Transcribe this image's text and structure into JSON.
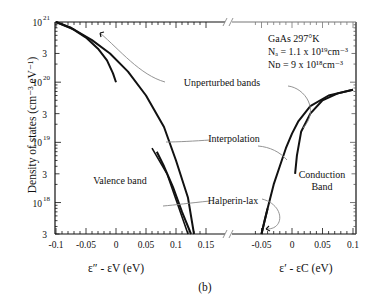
{
  "chart_data": {
    "type": "line",
    "title": "",
    "subfigure_label": "(b)",
    "ylabel": "Density of states (cm⁻³ eV⁻¹)",
    "yscale": "log",
    "ylim": [
      3e+17,
      1e+21
    ],
    "y_ticks": [
      {
        "value": 1e+21,
        "label_base": "10",
        "label_exp": "21"
      },
      {
        "value": 3e+20,
        "label_base": "3",
        "label_exp": ""
      },
      {
        "value": 1e+20,
        "label_base": "10",
        "label_exp": "20"
      },
      {
        "value": 3e+19,
        "label_base": "3",
        "label_exp": ""
      },
      {
        "value": 1e+19,
        "label_base": "10",
        "label_exp": "19"
      },
      {
        "value": 3e+18,
        "label_base": "3",
        "label_exp": ""
      },
      {
        "value": 1e+18,
        "label_base": "10",
        "label_exp": "18"
      },
      {
        "value": 3e+17,
        "label_base": "3",
        "label_exp": ""
      }
    ],
    "info_box": {
      "material": "GaAs  297°K",
      "NA": "Nₐ = 1.1 x 10¹⁹cm⁻³",
      "ND": "Nᴅ = 9 x 10¹⁸cm⁻³"
    },
    "panels": [
      {
        "name": "valence",
        "xlabel": "ε″ - εV (eV)",
        "xlim": [
          -0.1,
          0.15
        ],
        "x_ticks": [
          "-0.1",
          "-0.05",
          "0",
          "0.05",
          "0.1",
          "0.15"
        ],
        "region_label": "Valence band",
        "series": [
          {
            "name": "Unperturbed bands",
            "x": [
              -0.1,
              -0.075,
              -0.05,
              -0.03,
              -0.015,
              -0.005,
              0.0
            ],
            "y": [
              1e+21,
              8e+20,
              5.5e+20,
              3.6e+20,
              2.3e+20,
              1.4e+20,
              1e+20
            ]
          },
          {
            "name": "Interpolation",
            "x": [
              -0.1,
              -0.07,
              -0.04,
              -0.01,
              0.02,
              0.05,
              0.08,
              0.1,
              0.12,
              0.13
            ],
            "y": [
              1e+21,
              7.5e+20,
              5e+20,
              3e+20,
              1.5e+20,
              6e+19,
              1.8e+19,
              5e+18,
              1.2e+18,
              3e+17
            ]
          },
          {
            "name": "Halperin-lax",
            "x": [
              0.068,
              0.08,
              0.095,
              0.11,
              0.125
            ],
            "y": [
              7e+18,
              4e+18,
              1.8e+18,
              7e+17,
              3e+17
            ]
          }
        ]
      },
      {
        "name": "conduction",
        "xlabel": "ε′ - εC (eV)",
        "xlim": [
          -0.06,
          0.1
        ],
        "x_ticks": [
          "-0.05",
          "0",
          "0.05",
          "0.1"
        ],
        "region_label": "Conduction Band",
        "series": [
          {
            "name": "Unperturbed bands",
            "x": [
              0.005,
              0.008,
              0.015,
              0.03,
              0.05,
              0.075,
              0.1
            ],
            "y": [
              3e+18,
              6e+18,
              1.5e+19,
              3e+19,
              5e+19,
              6.5e+19,
              7.5e+19
            ]
          },
          {
            "name": "Interpolation",
            "x": [
              -0.05,
              -0.04,
              -0.03,
              -0.02,
              -0.01,
              0.0,
              0.01,
              0.03,
              0.06,
              0.1
            ],
            "y": [
              3e+17,
              8e+17,
              2e+18,
              4e+18,
              8e+18,
              1.4e+19,
              2.2e+19,
              4e+19,
              6e+19,
              7.5e+19
            ]
          },
          {
            "name": "Halperin-lax",
            "x": [
              -0.05,
              -0.045,
              -0.04
            ],
            "y": [
              3e+17,
              5e+17,
              8e+17
            ]
          }
        ]
      }
    ],
    "annotations": [
      "Unperturbed bands",
      "Interpolation",
      "Halperin-lax"
    ]
  }
}
